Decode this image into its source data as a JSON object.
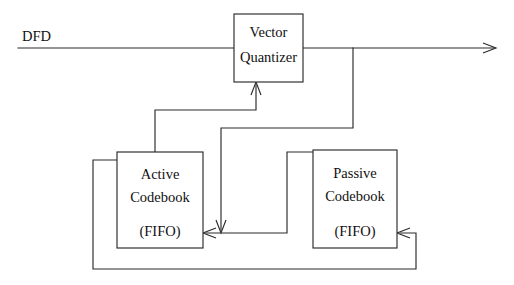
{
  "diagram": {
    "type": "block-diagram",
    "canvas": {
      "width": 514,
      "height": 285
    },
    "stroke_color": "#2b2b2b",
    "text_color": "#111111",
    "background_color": "#ffffff",
    "blocks": [
      {
        "id": "vector-quantizer",
        "line1": "Vector",
        "line2": "Quantizer",
        "x": 234,
        "y": 14,
        "w": 69,
        "h": 68
      },
      {
        "id": "active-codebook",
        "line1": "Active",
        "line2": "Codebook",
        "line3": "(FIFO)",
        "x": 117,
        "y": 152,
        "w": 86,
        "h": 96
      },
      {
        "id": "passive-codebook",
        "line1": "Passive",
        "line2": "Codebook",
        "line3": "(FIFO)",
        "x": 313,
        "y": 150,
        "w": 84,
        "h": 98
      }
    ],
    "signals": [
      {
        "id": "dfd-input",
        "label": "DFD",
        "x": 22,
        "y": 38
      }
    ],
    "connections": [
      {
        "id": "dfd-to-vq",
        "from": "dfd-input",
        "to": "vector-quantizer",
        "arrow": false
      },
      {
        "id": "vq-output",
        "from": "vector-quantizer",
        "to": "output",
        "arrow": true
      },
      {
        "id": "output-tap-to-active",
        "from": "vq-output",
        "to": "active-codebook",
        "arrow": true
      },
      {
        "id": "active-to-vq",
        "from": "active-codebook",
        "to": "vector-quantizer",
        "arrow": true
      },
      {
        "id": "passive-to-active",
        "from": "passive-codebook",
        "to": "active-codebook",
        "arrow": true
      },
      {
        "id": "active-to-passive-feedback",
        "from": "active-codebook",
        "to": "passive-codebook",
        "arrow": true
      }
    ]
  }
}
